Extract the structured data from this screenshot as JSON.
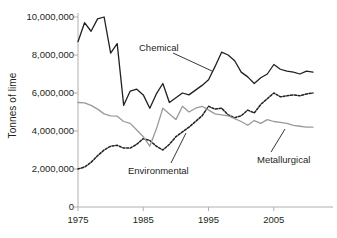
{
  "axis": {
    "ylabel": "Tonnes of lime",
    "ytick_labels": [
      "10,000,000",
      "8,000,000",
      "6,000,000",
      "4,000,000",
      "2,000,000",
      "0"
    ],
    "xtick_labels": [
      "1975",
      "1985",
      "1995",
      "2005"
    ]
  },
  "annotations": {
    "chemical": "Chemical",
    "environmental": "Environmental",
    "metallurgical": "Metallurgical"
  },
  "colors": {
    "chemical": "#231f20",
    "environmental": "#231f20",
    "metallurgical": "#9a9a9a",
    "axis": "#b0b0b0"
  },
  "chart_data": {
    "type": "line",
    "title": "",
    "xlabel": "",
    "ylabel": "Tonnes of lime",
    "xlim": [
      1975,
      2011
    ],
    "ylim": [
      0,
      10000000
    ],
    "yticks": [
      0,
      2000000,
      4000000,
      6000000,
      8000000,
      10000000
    ],
    "xticks": [
      1975,
      1985,
      1995,
      2005
    ],
    "grid": false,
    "legend": "inline-annotations",
    "x": [
      1975,
      1976,
      1977,
      1978,
      1979,
      1980,
      1981,
      1982,
      1983,
      1984,
      1985,
      1986,
      1987,
      1988,
      1989,
      1990,
      1991,
      1992,
      1993,
      1994,
      1995,
      1996,
      1997,
      1998,
      1999,
      2000,
      2001,
      2002,
      2003,
      2004,
      2005,
      2006,
      2007,
      2008,
      2009,
      2010,
      2011
    ],
    "series": [
      {
        "name": "Chemical",
        "style": "solid",
        "color": "#231f20",
        "values": [
          8700000,
          9700000,
          9250000,
          9900000,
          10000000,
          8100000,
          8600000,
          5350000,
          6100000,
          6200000,
          5900000,
          5200000,
          5950000,
          6500000,
          5500000,
          5750000,
          6000000,
          5900000,
          6150000,
          6400000,
          6700000,
          7400000,
          8150000,
          8000000,
          7700000,
          7100000,
          6850000,
          6500000,
          6800000,
          7000000,
          7500000,
          7250000,
          7150000,
          7100000,
          7000000,
          7150000,
          7100000
        ]
      },
      {
        "name": "Environmental",
        "style": "dotted",
        "color": "#231f20",
        "values": [
          2000000,
          2100000,
          2350000,
          2700000,
          3000000,
          3200000,
          3250000,
          3100000,
          3100000,
          3300000,
          3600000,
          3500000,
          3200000,
          3000000,
          3300000,
          3700000,
          3950000,
          4200000,
          4500000,
          4800000,
          5300000,
          5150000,
          5200000,
          4850000,
          4700000,
          4800000,
          5100000,
          4950000,
          5400000,
          5700000,
          6000000,
          5800000,
          5850000,
          5900000,
          5850000,
          5950000,
          6000000
        ]
      },
      {
        "name": "Metallurgical",
        "style": "solid",
        "color": "#9a9a9a",
        "values": [
          5500000,
          5480000,
          5350000,
          5150000,
          4900000,
          4800000,
          4780000,
          4500000,
          4400000,
          4050000,
          3700000,
          3200000,
          4100000,
          5200000,
          4900000,
          4600000,
          5300000,
          5000000,
          5200000,
          5300000,
          5100000,
          4900000,
          4850000,
          4800000,
          4650000,
          4500000,
          4300000,
          4550000,
          4400000,
          4600000,
          4500000,
          4450000,
          4400000,
          4300000,
          4250000,
          4200000,
          4200000
        ]
      }
    ]
  }
}
